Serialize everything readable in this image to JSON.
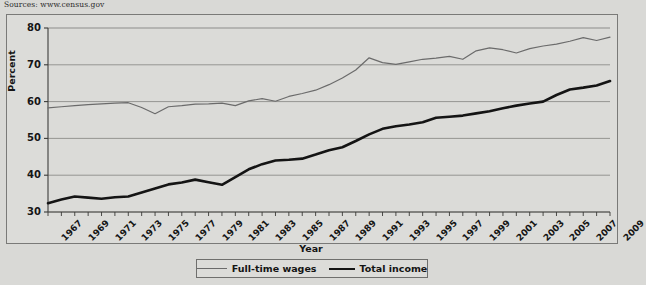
{
  "sources_note": "Sources: www.census.gov",
  "axis": {
    "y_title": "Percent",
    "x_title": "Year",
    "y_ticks": [
      "80",
      "70",
      "60",
      "50",
      "40",
      "30"
    ]
  },
  "legend": {
    "items": [
      {
        "label": "Full-time wages",
        "color": "#6b6b6b",
        "style": "thin"
      },
      {
        "label": "Total income",
        "color": "#141414",
        "style": "thick"
      }
    ]
  },
  "chart_data": {
    "type": "line",
    "title": "",
    "subtitle": "",
    "xlabel": "Year",
    "ylabel": "Percent",
    "xlim": [
      1967,
      2009
    ],
    "ylim": [
      30,
      80
    ],
    "yticks": [
      30,
      40,
      50,
      60,
      70,
      80
    ],
    "grid": "horizontal",
    "legend_position": "bottom-center",
    "x": [
      1967,
      1968,
      1969,
      1970,
      1971,
      1972,
      1973,
      1974,
      1975,
      1976,
      1977,
      1978,
      1979,
      1980,
      1981,
      1982,
      1983,
      1984,
      1985,
      1986,
      1987,
      1988,
      1989,
      1990,
      1991,
      1992,
      1993,
      1994,
      1995,
      1996,
      1997,
      1998,
      1999,
      2000,
      2001,
      2002,
      2003,
      2004,
      2005,
      2006,
      2007,
      2008,
      2009
    ],
    "xtick_labels": [
      "1967",
      "1969",
      "1971",
      "1973",
      "1975",
      "1977",
      "1979",
      "1981",
      "1983",
      "1985",
      "1987",
      "1989",
      "1991",
      "1993",
      "1995",
      "1997",
      "1999",
      "2001",
      "2003",
      "2005",
      "2007",
      "2009"
    ],
    "xtick_values": [
      1967,
      1969,
      1971,
      1973,
      1975,
      1977,
      1979,
      1981,
      1983,
      1985,
      1987,
      1989,
      1991,
      1993,
      1995,
      1997,
      1999,
      2001,
      2003,
      2005,
      2007,
      2009
    ],
    "series": [
      {
        "name": "Full-time wages",
        "color": "#6b6b6b",
        "width": 1.2,
        "values": [
          58.3,
          58.6,
          58.9,
          59.2,
          59.4,
          59.6,
          59.7,
          58.4,
          56.7,
          58.6,
          58.9,
          59.3,
          59.4,
          59.6,
          58.9,
          60.2,
          60.8,
          60.1,
          61.4,
          62.2,
          63.1,
          64.6,
          66.4,
          68.6,
          71.9,
          70.6,
          70.1,
          70.8,
          71.5,
          71.8,
          72.3,
          71.5,
          73.8,
          74.6,
          74.1,
          73.2,
          74.4,
          75.1,
          75.6,
          76.4,
          77.4,
          76.6,
          77.5
        ]
      },
      {
        "name": "Total income",
        "color": "#141414",
        "width": 2.6,
        "values": [
          32.4,
          33.4,
          34.2,
          33.9,
          33.6,
          34.0,
          34.2,
          35.3,
          36.4,
          37.5,
          38.0,
          38.8,
          38.1,
          37.4,
          39.5,
          41.6,
          43.0,
          44.0,
          44.2,
          44.5,
          45.6,
          46.8,
          47.6,
          49.3,
          51.1,
          52.6,
          53.3,
          53.8,
          54.4,
          55.6,
          55.9,
          56.2,
          56.8,
          57.4,
          58.2,
          58.9,
          59.5,
          60.0,
          61.8,
          63.3,
          63.8,
          64.4,
          65.6
        ]
      }
    ]
  }
}
